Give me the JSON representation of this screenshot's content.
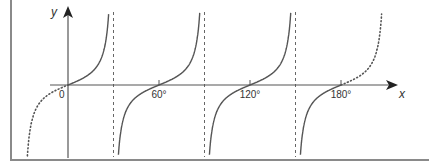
{
  "chart_data": {
    "type": "line",
    "title": "",
    "function": "y = tan(3x)",
    "xlabel": "x",
    "ylabel": "y",
    "origin_label": "0",
    "x_ticks": [
      {
        "value": 60,
        "label": "60°"
      },
      {
        "value": 120,
        "label": "120°"
      },
      {
        "value": 180,
        "label": "180°"
      }
    ],
    "xlim": [
      -40,
      205
    ],
    "asymptotes": [
      30,
      90,
      150
    ],
    "series": [
      {
        "name": "tan 3x (0° to 180°)",
        "style": "solid",
        "x_range": [
          0,
          180
        ]
      },
      {
        "name": "tan 3x extension (x<0)",
        "style": "dotted",
        "x_range": [
          -28,
          0
        ]
      },
      {
        "name": "tan 3x extension (x>180)",
        "style": "dotted",
        "x_range": [
          180,
          208
        ]
      }
    ],
    "grid": false,
    "legend": null,
    "colors": {
      "curve": "#555555",
      "axis": "#555555",
      "asymptote": "#666666",
      "frame": "#8a8a8a"
    }
  }
}
